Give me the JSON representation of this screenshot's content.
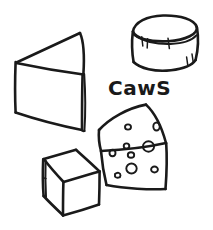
{
  "canvas": {
    "width": 213,
    "height": 230,
    "background_color": "#ffffff",
    "ink_color": "#1a1a1a",
    "medium": "hand-drawn pen sketch"
  },
  "label": {
    "text": "CawS",
    "x": 108,
    "y": 95
  },
  "objects": [
    {
      "id": "wedge-plain",
      "name": "cheese-wedge-plain",
      "description": "Large plain cheese wedge, apex pointing left",
      "holes": 0
    },
    {
      "id": "wheel-cylinder",
      "name": "cheese-wheel-cylinder",
      "description": "Round cheese wheel drawn as a cylinder with tick marks along the rind",
      "tick_marks": 5
    },
    {
      "id": "block-cube",
      "name": "cheese-block-cube",
      "description": "Cube shaped block of cheese in three-quarter view",
      "holes": 0
    },
    {
      "id": "wedge-swiss",
      "name": "cheese-wedge-swiss",
      "description": "Swiss cheese wedge with round holes on its faces",
      "holes": 10
    }
  ]
}
